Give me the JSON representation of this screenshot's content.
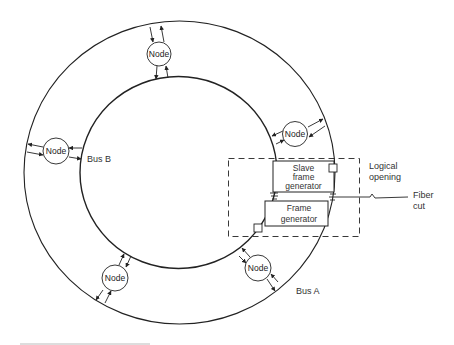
{
  "diagram": {
    "type": "dual-bus ring topology",
    "buses": [
      {
        "id": "bus-a",
        "label": "Bus A",
        "ring": "outer"
      },
      {
        "id": "bus-b",
        "label": "Bus B",
        "ring": "inner"
      }
    ],
    "nodes": [
      {
        "id": "node-top",
        "label": "Node"
      },
      {
        "id": "node-left",
        "label": "Node"
      },
      {
        "id": "node-right",
        "label": "Node"
      },
      {
        "id": "node-bottom-left",
        "label": "Node"
      },
      {
        "id": "node-bottom-right",
        "label": "Node"
      }
    ],
    "slave_frame_generator": {
      "lines": [
        "Slave",
        "frame",
        "generator"
      ]
    },
    "frame_generator": {
      "lines": [
        "Frame",
        "generator"
      ]
    },
    "logical_opening": {
      "lines": [
        "Logical",
        "opening"
      ]
    },
    "fiber_cut": {
      "lines": [
        "Fiber",
        "cut"
      ]
    },
    "colors": {
      "stroke": "#222222",
      "text": "#333333",
      "background": "#ffffff"
    }
  }
}
